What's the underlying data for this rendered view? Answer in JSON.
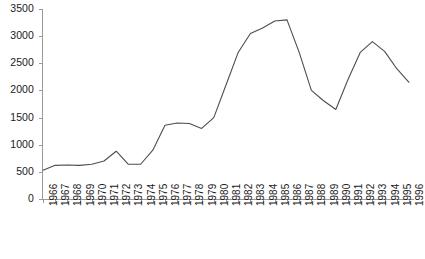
{
  "chart_data": {
    "type": "line",
    "title": "",
    "subtitle": "",
    "xlabel": "",
    "ylabel": "",
    "grid": false,
    "legend": false,
    "xlim": [
      1966,
      1996
    ],
    "ylim": [
      0,
      3500
    ],
    "ytick_step": 500,
    "yticks": [
      0,
      500,
      1000,
      1500,
      2000,
      2500,
      3000,
      3500
    ],
    "ytick_labels": [
      "0",
      "500",
      "1000",
      "1500",
      "2000",
      "2500",
      "3000",
      "3500"
    ],
    "categories": [
      "1966",
      "1967",
      "1968",
      "1969",
      "1970",
      "1971",
      "1972",
      "1973",
      "1974",
      "1975",
      "1976",
      "1977",
      "1978",
      "1979",
      "1980",
      "1981",
      "1982",
      "1983",
      "1984",
      "1985",
      "1986",
      "1987",
      "1988",
      "1989",
      "1990",
      "1991",
      "1992",
      "1993",
      "1994",
      "1995",
      "1996"
    ],
    "series": [
      {
        "name": "series-1",
        "color": "#4d4d4d",
        "values": [
          530,
          620,
          625,
          620,
          640,
          700,
          880,
          640,
          640,
          900,
          1360,
          1400,
          1390,
          1300,
          1500,
          2100,
          2700,
          3050,
          3150,
          3280,
          3300,
          2700,
          2000,
          1810,
          1650,
          2200,
          2700,
          2900,
          2720,
          2400,
          2150
        ]
      }
    ]
  }
}
